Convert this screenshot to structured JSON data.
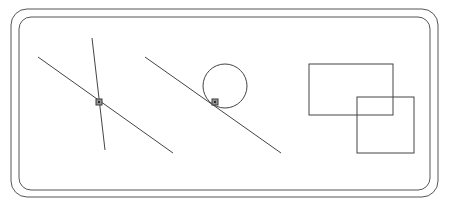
{
  "canvas": {
    "width": 450,
    "height": 206,
    "background_color": "#ffffff",
    "title": "Geometric figures canvas"
  },
  "frame": {
    "name": "rounded-double-border",
    "stroke_color": "#555555",
    "stroke_width": 1,
    "corner_radius": 16,
    "outer": {
      "x": 11,
      "y": 9,
      "width": 427,
      "height": 188
    },
    "inner": {
      "x": 19,
      "y": 17,
      "width": 411,
      "height": 173
    }
  },
  "shapes": {
    "stroke_color": "#444444",
    "stroke_width": 1,
    "marker_fill": "#9a9a9a",
    "marker_stroke": "#3a3a3a",
    "marker_size": 6,
    "lines": [
      {
        "id": "line-a",
        "label": "Left long diagonal",
        "x1": 38,
        "y1": 57,
        "x2": 173,
        "y2": 153
      },
      {
        "id": "line-b",
        "label": "Left steep line",
        "x1": 92,
        "y1": 38,
        "x2": 105,
        "y2": 150
      },
      {
        "id": "line-c",
        "label": "Right long diagonal through circle",
        "x1": 145,
        "y1": 57,
        "x2": 281,
        "y2": 153
      }
    ],
    "circles": [
      {
        "id": "circle-a",
        "label": "Circle tangent to right diagonal",
        "cx": 225,
        "cy": 86,
        "r": 22
      }
    ],
    "rectangles": [
      {
        "id": "rect-a",
        "label": "Upper left rectangle",
        "x": 309,
        "y": 64,
        "width": 84,
        "height": 51
      },
      {
        "id": "rect-b",
        "label": "Lower right rectangle",
        "x": 357,
        "y": 97,
        "width": 57,
        "height": 56
      }
    ],
    "intersection_markers": [
      {
        "id": "marker-1",
        "label": "Intersection of left long diagonal and left steep line",
        "cx": 99,
        "cy": 102
      },
      {
        "id": "marker-2",
        "label": "Intersection of right diagonal and circle",
        "cx": 215,
        "cy": 102
      }
    ]
  }
}
